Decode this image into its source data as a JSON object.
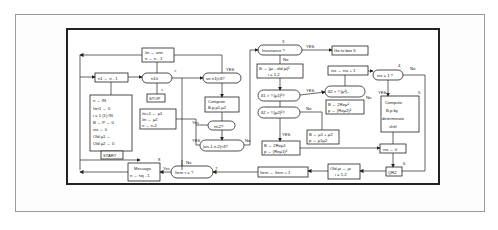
{
  "figure": {
    "type": "flowchart"
  },
  "nodes": {
    "deflate_top": {
      "line1": "λn ← ann",
      "line2": "n ← n - 1"
    },
    "n1_box": {
      "label": "n1 ← n - 1"
    },
    "n10": {
      "label": "n10"
    },
    "gt_mark": {
      "label": ">"
    },
    "lt_mark": {
      "label": "<"
    },
    "stop": {
      "label": "STOP"
    },
    "init_box": {
      "lines": [
        "n ← IN",
        "Iter1 ← 0",
        "i = 1 (1) IN",
        "B ← P ← 0",
        "nix ← 0",
        "Old μ1 ←",
        "Old μ2 ← 0"
      ]
    },
    "start": {
      "label": "START"
    },
    "lambda_pair": {
      "lines": [
        "λn+1 ← μ1",
        "λn ← μ2",
        "n ← n-2"
      ]
    },
    "message": {
      "line1": "Message",
      "line2": "n ← nq - 1"
    },
    "cond_an": {
      "label": "an n1|<δ?"
    },
    "compute_mu": {
      "line1": "Compute",
      "line2": "B,p,μ1,μ2"
    },
    "n2": {
      "label": "n≤2?"
    },
    "cond_an_n2": {
      "label": "|an-1 n-2|<δ?"
    },
    "iter_check": {
      "label": "Itern   τ = ?"
    },
    "invariance": {
      "label": "Invariance ?",
      "marker": "3"
    },
    "goto5": {
      "label": "Go to box 5"
    },
    "delta_box": {
      "line1": "δi ← |μi - old μi|²",
      "line2": "i = 1,2"
    },
    "delta1": {
      "label": "δ1 > ¼|μ1|²?"
    },
    "delta2": {
      "label": "δ2 > ¼|μ2|²?"
    },
    "delta_x": {
      "label": "δ2 > ¼|μ²|₂"
    },
    "bp_re1": {
      "line1": "B ← 2Reμ1",
      "line2": "p ← (Reμ1)²"
    },
    "bp_re2": {
      "line1": "B ← 2Reμ²",
      "line2": "p ← (Reμ2)²"
    },
    "bp_sum": {
      "line1": "B ← μ1 + μ2",
      "line2": "p ← μ1μ2"
    },
    "nix_inc": {
      "label": "nix ← nix + 1"
    },
    "nix_check": {
      "label": "nix = 1 ?",
      "marker": "4"
    },
    "compute_shift": {
      "lines": [
        "Compute",
        "B,p by",
        "determinate",
        "shift"
      ],
      "marker": "5"
    },
    "nix_zero": {
      "label": "nix ← 0"
    },
    "qr2": {
      "label": "QR2",
      "marker": "6"
    },
    "old_mu": {
      "line1": "Old μi ← μi",
      "line2": "i = 1,2"
    },
    "iter_inc": {
      "label": "Itern ← Itern + 1"
    },
    "marker_7": {
      "label": "7"
    },
    "marker_8": {
      "label": "8"
    }
  },
  "edge_labels": {
    "yes": "YES",
    "Yes": "Yes",
    "no": "No"
  }
}
